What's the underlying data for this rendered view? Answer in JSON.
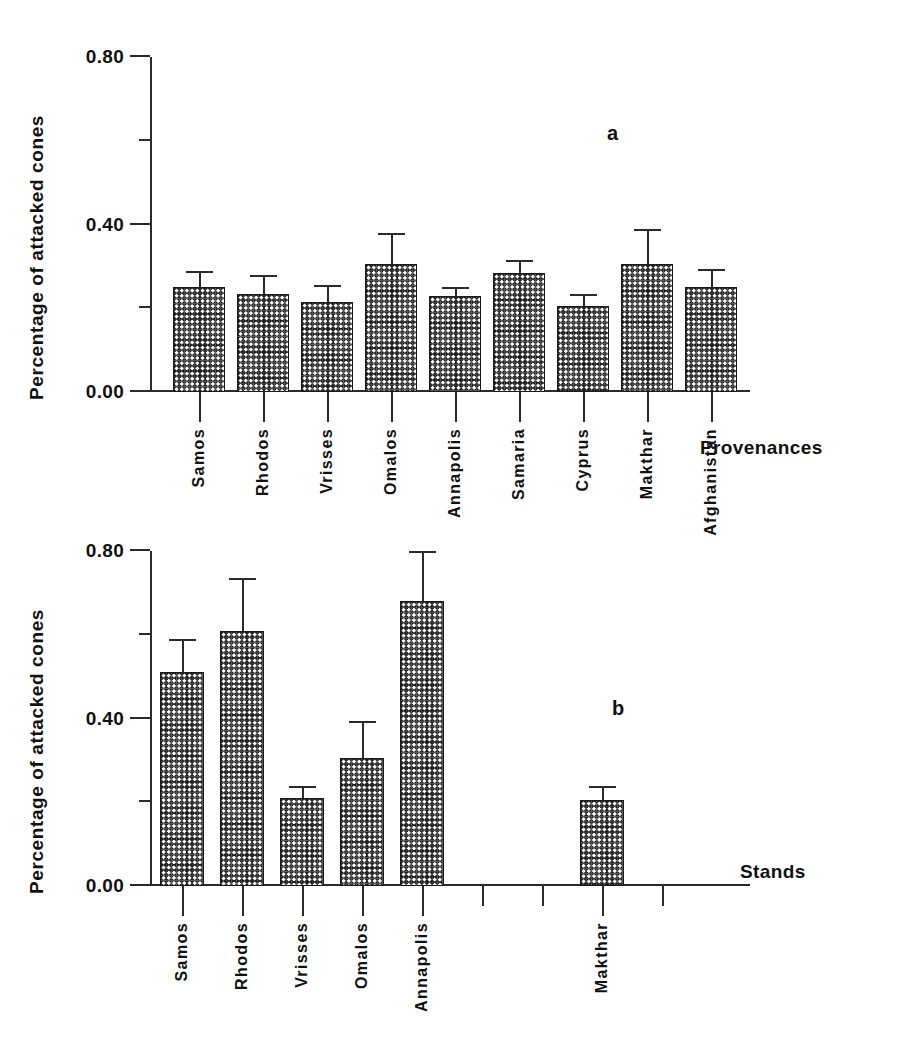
{
  "figure": {
    "background": "#ffffff",
    "bar_fill": "#1e1e1e",
    "axis_color": "#2b2b2b"
  },
  "panels": [
    {
      "tag": "a",
      "ylabel": "Percentage of attacked cones",
      "xlabel": "Provenances",
      "yticks": [
        "0.00",
        "0.40",
        "0.80"
      ],
      "ylim": [
        0.0,
        0.8
      ],
      "categories": [
        "Samos",
        "Rhodos",
        "Vrisses",
        "Omalos",
        "Annapolis",
        "Samaria",
        "Cyprus",
        "Makthar",
        "Afghanistan"
      ]
    },
    {
      "tag": "b",
      "ylabel": "Percentage of attacked cones",
      "xlabel": "Stands",
      "yticks": [
        "0.00",
        "0.40",
        "0.80"
      ],
      "ylim": [
        0.0,
        0.8
      ],
      "categories": [
        "Samos",
        "Rhodos",
        "Vrisses",
        "Omalos",
        "Annapolis",
        "",
        "",
        "Makthar",
        ""
      ]
    }
  ],
  "chart_data": [
    {
      "type": "bar",
      "panel": "a",
      "title": "",
      "xlabel": "Provenances",
      "ylabel": "Percentage of attacked cones",
      "ylim": [
        0.0,
        0.8
      ],
      "ytick_values": [
        0.0,
        0.2,
        0.4,
        0.6,
        0.8
      ],
      "ytick_labels": [
        "0.00",
        "",
        "0.40",
        "",
        "0.80"
      ],
      "minor_ticks": [
        0.2,
        0.6
      ],
      "grid": false,
      "legend": null,
      "errorbars": "upper only",
      "categories": [
        "Samos",
        "Rhodos",
        "Vrisses",
        "Omalos",
        "Annapolis",
        "Samaria",
        "Cyprus",
        "Makthar",
        "Afghanistan"
      ],
      "values": [
        0.25,
        0.235,
        0.215,
        0.305,
        0.23,
        0.285,
        0.205,
        0.305,
        0.25
      ],
      "errors": [
        0.035,
        0.04,
        0.035,
        0.07,
        0.015,
        0.025,
        0.025,
        0.08,
        0.04
      ],
      "annotations": [
        "a"
      ]
    },
    {
      "type": "bar",
      "panel": "b",
      "title": "",
      "xlabel": "Stands",
      "ylabel": "Percentage of attacked cones",
      "ylim": [
        0.0,
        0.8
      ],
      "ytick_values": [
        0.0,
        0.2,
        0.4,
        0.6,
        0.8
      ],
      "ytick_labels": [
        "0.00",
        "",
        "0.40",
        "",
        "0.80"
      ],
      "minor_ticks": [
        0.2,
        0.6
      ],
      "grid": false,
      "legend": null,
      "errorbars": "upper only",
      "categories": [
        "Samos",
        "Rhodos",
        "Vrisses",
        "Omalos",
        "Annapolis",
        "",
        "",
        "Makthar",
        ""
      ],
      "values": [
        0.51,
        0.61,
        0.21,
        0.305,
        0.68,
        null,
        null,
        0.205,
        null
      ],
      "errors": [
        0.075,
        0.12,
        0.025,
        0.085,
        0.115,
        null,
        null,
        0.03,
        null
      ],
      "annotations": [
        "b"
      ]
    }
  ]
}
